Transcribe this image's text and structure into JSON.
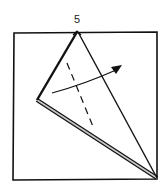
{
  "diagram": {
    "type": "origami-fold-step",
    "step_number": "5",
    "colors": {
      "line": "#111111",
      "paper": "#ffffff",
      "edge_fill": "#c8c8c8"
    },
    "elements": {
      "paper_square": "square outline",
      "kite_flap": "triangular flap from top apex to left point to bottom-right corner",
      "valley_fold_line": "dashed line",
      "fold_arrow": "curved arrow pointing right"
    }
  }
}
